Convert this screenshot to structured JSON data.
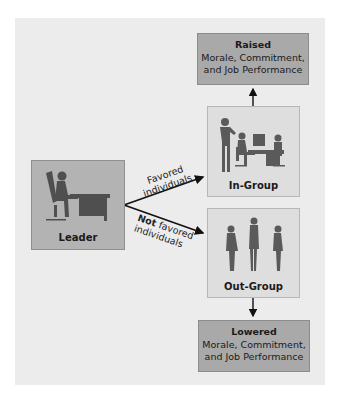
{
  "diagram": {
    "type": "flow",
    "nodes": {
      "raised": {
        "title": "Raised",
        "line1": "Morale, Commitment,",
        "line2": "and Job Performance"
      },
      "in_group": {
        "label": "In-Group",
        "illustration": "people-at-office-desk"
      },
      "leader": {
        "label": "Leader",
        "illustration": "person-seated-at-desk"
      },
      "out_group": {
        "label": "Out-Group",
        "illustration": "three-standing-people"
      },
      "lowered": {
        "title": "Lowered",
        "line1": "Morale, Commitment,",
        "line2": "and Job Performance"
      }
    },
    "edges": {
      "favored": {
        "line1": "Favored",
        "line2": "individuals"
      },
      "not_favored": {
        "emphasis": "Not",
        "line1_rest": " favored",
        "line2": "individuals"
      }
    },
    "colors": {
      "panel": "#ececec",
      "outcome_box": "#a9a9a9",
      "group_box": "#dedede",
      "leader_box": "#b3b3b3",
      "silhouette": "#555555"
    }
  }
}
